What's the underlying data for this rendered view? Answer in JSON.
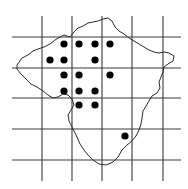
{
  "map": {
    "width": 188,
    "height": 189,
    "colors": {
      "background": "#ffffff",
      "grid": "#3a3a3a",
      "outline": "#2a2a2a",
      "dot": "#000000"
    },
    "grid": {
      "vertical_x": [
        42,
        72,
        102,
        132,
        163
      ],
      "horizontal_y": [
        37,
        68,
        98,
        129,
        160
      ],
      "x_extent": [
        12,
        181
      ],
      "y_extent": [
        16,
        181
      ]
    },
    "outline_points": [
      [
        17,
        65
      ],
      [
        22,
        58
      ],
      [
        28,
        55
      ],
      [
        33,
        51
      ],
      [
        38,
        49
      ],
      [
        44,
        47
      ],
      [
        50,
        44
      ],
      [
        55,
        40
      ],
      [
        60,
        37
      ],
      [
        64,
        35
      ],
      [
        70,
        37
      ],
      [
        74,
        32
      ],
      [
        78,
        28
      ],
      [
        83,
        26
      ],
      [
        88,
        23
      ],
      [
        93,
        22
      ],
      [
        98,
        21
      ],
      [
        103,
        19
      ],
      [
        108,
        18
      ],
      [
        112,
        21
      ],
      [
        115,
        27
      ],
      [
        119,
        31
      ],
      [
        124,
        34
      ],
      [
        129,
        38
      ],
      [
        134,
        41
      ],
      [
        139,
        44
      ],
      [
        144,
        47
      ],
      [
        149,
        50
      ],
      [
        154,
        52
      ],
      [
        159,
        53
      ],
      [
        164,
        52
      ],
      [
        169,
        53
      ],
      [
        174,
        56
      ],
      [
        173,
        61
      ],
      [
        168,
        64
      ],
      [
        164,
        67
      ],
      [
        163,
        72
      ],
      [
        161,
        77
      ],
      [
        159,
        82
      ],
      [
        160,
        88
      ],
      [
        157,
        93
      ],
      [
        152,
        96
      ],
      [
        149,
        101
      ],
      [
        146,
        106
      ],
      [
        143,
        111
      ],
      [
        142,
        118
      ],
      [
        141,
        124
      ],
      [
        139,
        130
      ],
      [
        136,
        136
      ],
      [
        132,
        141
      ],
      [
        127,
        145
      ],
      [
        122,
        150
      ],
      [
        118,
        157
      ],
      [
        113,
        162
      ],
      [
        106,
        165
      ],
      [
        99,
        164
      ],
      [
        93,
        160
      ],
      [
        88,
        155
      ],
      [
        84,
        150
      ],
      [
        80,
        144
      ],
      [
        77,
        137
      ],
      [
        73,
        129
      ],
      [
        69,
        121
      ],
      [
        68,
        115
      ],
      [
        71,
        110
      ],
      [
        74,
        105
      ],
      [
        72,
        99
      ],
      [
        68,
        95
      ],
      [
        63,
        94
      ],
      [
        58,
        97
      ],
      [
        53,
        98
      ],
      [
        48,
        95
      ],
      [
        43,
        91
      ],
      [
        37,
        87
      ],
      [
        31,
        84
      ],
      [
        26,
        79
      ],
      [
        21,
        74
      ],
      [
        17,
        69
      ]
    ],
    "dots": [
      {
        "x": 64,
        "y": 44
      },
      {
        "x": 79,
        "y": 44
      },
      {
        "x": 95,
        "y": 44
      },
      {
        "x": 110,
        "y": 44
      },
      {
        "x": 50,
        "y": 60
      },
      {
        "x": 64,
        "y": 60
      },
      {
        "x": 95,
        "y": 60
      },
      {
        "x": 64,
        "y": 75
      },
      {
        "x": 79,
        "y": 75
      },
      {
        "x": 110,
        "y": 75
      },
      {
        "x": 64,
        "y": 91
      },
      {
        "x": 79,
        "y": 91
      },
      {
        "x": 95,
        "y": 91
      },
      {
        "x": 79,
        "y": 105
      },
      {
        "x": 95,
        "y": 105
      },
      {
        "x": 125,
        "y": 136
      }
    ],
    "dot_radius": 3.6
  }
}
